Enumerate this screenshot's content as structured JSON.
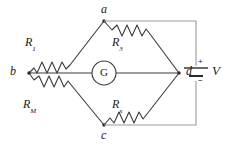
{
  "figure": {
    "background_color": "#ffffff",
    "line_color": "#3a3a3a",
    "text_color": "#1a1a1a",
    "width": 235,
    "height": 146
  },
  "nodes": [
    {
      "id": "a",
      "label": "a",
      "x": 104,
      "y": 21,
      "label_x": 101,
      "label_y": 3
    },
    {
      "id": "b",
      "label": "b",
      "x": 29,
      "y": 73,
      "label_x": 10,
      "label_y": 66
    },
    {
      "id": "c",
      "label": "c",
      "x": 104,
      "y": 125,
      "label_x": 101,
      "label_y": 130
    },
    {
      "id": "d",
      "label": "d",
      "x": 179,
      "y": 73,
      "label_x": 186,
      "label_y": 66
    }
  ],
  "resistors": [
    {
      "id": "r1",
      "label_main": "R",
      "label_sub": "1",
      "between": [
        "b",
        "a"
      ],
      "label_x": 26,
      "label_y": 37
    },
    {
      "id": "r3",
      "label_main": "R",
      "label_sub": "3",
      "between": [
        "a",
        "d"
      ],
      "label_x": 112,
      "label_y": 37
    },
    {
      "id": "rm",
      "label_main": "R",
      "label_sub": "M",
      "between": [
        "b",
        "c"
      ],
      "label_x": 24,
      "label_y": 99
    },
    {
      "id": "rx",
      "label_main": "R",
      "label_sub": "x",
      "between": [
        "c",
        "d"
      ],
      "label_x": 112,
      "label_y": 99
    }
  ],
  "galvanometer": {
    "label": "G",
    "center_x": 104,
    "center_y": 73,
    "radius": 12
  },
  "source": {
    "label": "V",
    "plus_sign": "+",
    "minus_sign": "−",
    "x": 196,
    "y": 73,
    "label_x": 212,
    "label_y": 65
  },
  "wires": {
    "description": "Outer loop connects node a up and right to battery top, and node c down and right to battery bottom",
    "top_path": "a -> top-right corner -> battery positive",
    "bottom_path": "c -> bottom-right corner -> battery negative"
  }
}
